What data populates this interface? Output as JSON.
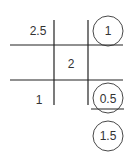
{
  "diagram": {
    "cells": {
      "top_left": "2.5",
      "middle_center": "2",
      "bottom_left": "1"
    },
    "circled_values": [
      "1",
      "0.5",
      "1.5"
    ],
    "colors": {
      "line": "#222222",
      "text": "#333333",
      "background": "#ffffff"
    }
  }
}
